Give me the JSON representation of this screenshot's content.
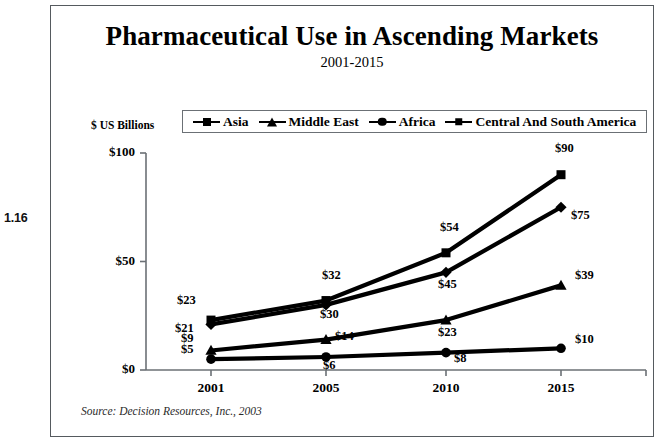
{
  "figure": {
    "number": "1.16"
  },
  "chart": {
    "title": "Pharmaceutical Use in Ascending Markets",
    "subtitle": "2001-2015",
    "unit_label": "$ US Billions",
    "source": "Source:  Decision Resources, Inc., 2003"
  },
  "chart_data": {
    "type": "line",
    "title": "Pharmaceutical Use in Ascending Markets",
    "subtitle": "2001-2015",
    "xlabel": "",
    "ylabel": "$ US Billions",
    "categories": [
      "2001",
      "2005",
      "2010",
      "2015"
    ],
    "ylim": [
      0,
      100
    ],
    "yticks": [
      0,
      50,
      100
    ],
    "ytick_labels": [
      "$0",
      "$50",
      "$100"
    ],
    "grid": false,
    "legend_position": "top",
    "series": [
      {
        "name": "Asia",
        "marker": "square",
        "color": "#000000",
        "values": [
          23,
          32,
          54,
          90
        ],
        "labels": [
          "$23",
          "$32",
          "$54",
          "$90"
        ]
      },
      {
        "name": "Middle East",
        "marker": "triangle",
        "color": "#000000",
        "values": [
          9,
          14,
          23,
          39
        ],
        "labels": [
          "$9",
          "$14",
          "$23",
          "$39"
        ]
      },
      {
        "name": "Africa",
        "marker": "circle",
        "color": "#000000",
        "values": [
          5,
          6,
          8,
          10
        ],
        "labels": [
          "$5",
          "$6",
          "$8",
          "$10"
        ]
      },
      {
        "name": "Central And South America",
        "marker": "diamond",
        "color": "#000000",
        "values": [
          21,
          30,
          45,
          75
        ],
        "labels": [
          "$21",
          "$30",
          "$45",
          "$75"
        ]
      }
    ],
    "annotations": [
      "Source:  Decision Resources, Inc., 2003"
    ]
  }
}
